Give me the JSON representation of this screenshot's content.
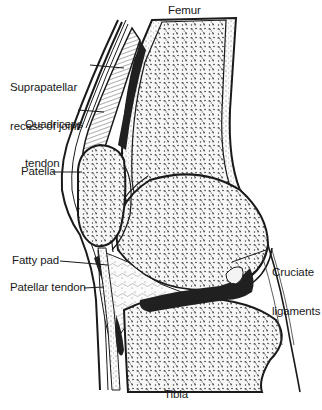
{
  "diagram": {
    "labels": {
      "femur": "Femur",
      "suprapatellar_line1": "Suprapatellar",
      "suprapatellar_line2": "recess of joint",
      "quadriceps_line1": "Quadriceps",
      "quadriceps_line2": "tendon",
      "patella": "Patella",
      "fatty_pad": "Fatty pad",
      "patellar_tendon": "Patellar tendon",
      "cruciate_line1": "Cruciate",
      "cruciate_line2": "ligaments",
      "tibia": "Tibia"
    },
    "colors": {
      "ink": "#1a1a1a",
      "background": "#ffffff",
      "bone_fill": "#f4f4f4",
      "dark_tissue": "#202020"
    }
  }
}
